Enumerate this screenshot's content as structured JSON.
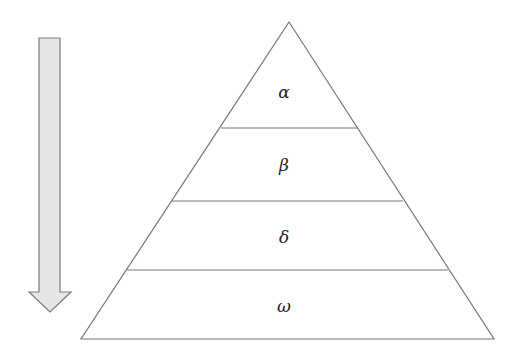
{
  "diagram": {
    "type": "pyramid",
    "levels": [
      {
        "label": "α"
      },
      {
        "label": "β"
      },
      {
        "label": "δ"
      },
      {
        "label": "ω"
      }
    ],
    "arrow": {
      "direction": "down",
      "fill_color": "#e6e6e6",
      "stroke_color": "#7a7a7a"
    },
    "line_color": "#777777"
  }
}
